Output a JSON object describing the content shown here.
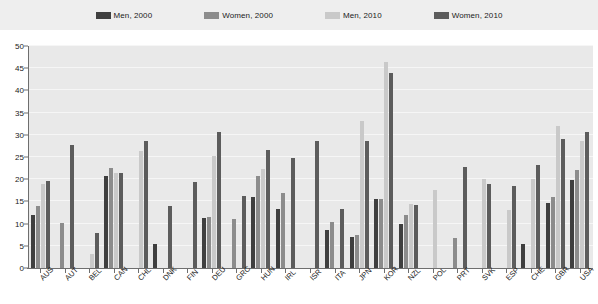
{
  "legend": {
    "items": [
      {
        "label": "Men, 2000",
        "color": "#3f3f3f"
      },
      {
        "label": "Women, 2000",
        "color": "#8c8c8c"
      },
      {
        "label": "Men, 2010",
        "color": "#c9c9c9"
      },
      {
        "label": "Women, 2010",
        "color": "#5c5c5c"
      }
    ]
  },
  "axis": {
    "y_ticks": [
      0,
      5,
      10,
      15,
      20,
      25,
      30,
      35,
      40,
      45,
      50
    ]
  },
  "chart_data": {
    "type": "bar",
    "title": "",
    "subtitle": "",
    "xlabel": "",
    "ylabel": "",
    "ylim": [
      0,
      50
    ],
    "grid": true,
    "legend_position": "top",
    "categories": [
      "AUS",
      "AUT",
      "BEL",
      "CAN",
      "CHL",
      "DNK",
      "FIN",
      "DEU",
      "GRC",
      "HUN",
      "IRL",
      "ISR",
      "ITA",
      "JPN",
      "KOR",
      "NZL",
      "POL",
      "PRT",
      "SVK",
      "ESP",
      "CHE",
      "GBR",
      "USA"
    ],
    "series": [
      {
        "name": "Men, 2000",
        "color": "#3f3f3f",
        "values": [
          12.0,
          null,
          null,
          20.8,
          null,
          5.5,
          null,
          11.3,
          null,
          16.0,
          13.3,
          null,
          8.5,
          7.0,
          15.5,
          10.0,
          null,
          null,
          null,
          null,
          5.5,
          14.7,
          19.8
        ]
      },
      {
        "name": "Women, 2000",
        "color": "#8c8c8c",
        "values": [
          14.0,
          10.2,
          null,
          22.5,
          null,
          null,
          null,
          11.5,
          11.0,
          20.8,
          17.0,
          null,
          10.3,
          7.5,
          15.5,
          12.0,
          null,
          6.7,
          null,
          null,
          null,
          16.0,
          22.0
        ]
      },
      {
        "name": "Men, 2010",
        "color": "#c9c9c9",
        "values": [
          19.0,
          null,
          3.2,
          21.5,
          26.3,
          null,
          null,
          25.3,
          null,
          22.3,
          null,
          null,
          null,
          33.0,
          46.5,
          14.5,
          17.5,
          null,
          20.0,
          13.0,
          20.0,
          32.0,
          28.5
        ]
      },
      {
        "name": "Women, 2010",
        "color": "#5c5c5c",
        "values": [
          19.7,
          27.8,
          7.8,
          21.3,
          28.7,
          14.0,
          19.3,
          30.7,
          16.3,
          26.5,
          24.7,
          28.7,
          13.3,
          28.5,
          44.0,
          14.3,
          null,
          22.7,
          19.0,
          18.5,
          23.3,
          29.0,
          30.7
        ]
      }
    ]
  }
}
